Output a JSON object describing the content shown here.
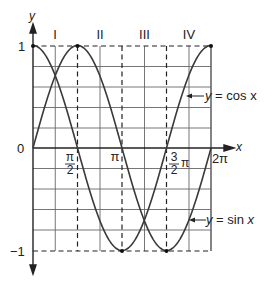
{
  "chart_data": {
    "type": "line",
    "title": "",
    "xlabel": "x",
    "ylabel": "y",
    "xlim": [
      0,
      6.2832
    ],
    "ylim": [
      -1,
      1
    ],
    "grid": true,
    "x_ticks": [
      {
        "value": 1.5708,
        "label_num": "π",
        "label_den": "2",
        "kind": "fraction"
      },
      {
        "value": 3.1416,
        "label": "π"
      },
      {
        "value": 4.7124,
        "label_num": "3",
        "label_den": "2",
        "label_suffix": "π",
        "kind": "mixed"
      },
      {
        "value": 6.2832,
        "label": "2π"
      }
    ],
    "y_ticks": [
      {
        "value": 1,
        "label": "1"
      },
      {
        "value": 0,
        "label": "0"
      },
      {
        "value": -1,
        "label": "−1"
      }
    ],
    "quadrant_labels": [
      "I",
      "II",
      "III",
      "IV"
    ],
    "series": [
      {
        "name": "y = sin x",
        "function": "sin",
        "x": [
          0,
          0.7854,
          1.5708,
          2.3562,
          3.1416,
          3.927,
          4.7124,
          5.4978,
          6.2832
        ],
        "values": [
          0,
          0.707,
          1,
          0.707,
          0,
          -0.707,
          -1,
          -0.707,
          0
        ]
      },
      {
        "name": "y = cos x",
        "function": "cos",
        "x": [
          0,
          0.7854,
          1.5708,
          2.3562,
          3.1416,
          3.927,
          4.7124,
          5.4978,
          6.2832
        ],
        "values": [
          1,
          0.707,
          0,
          -0.707,
          -1,
          -0.707,
          0,
          0.707,
          1
        ]
      }
    ],
    "annotations": [
      {
        "text": "y = cos x",
        "arrow_to_series": "cos",
        "position": "right"
      },
      {
        "text": "y = sin x",
        "arrow_to_series": "sin",
        "position": "right"
      }
    ],
    "marked_points": [
      {
        "x": 0,
        "y": 1
      },
      {
        "x": 1.5708,
        "y": 1
      },
      {
        "x": 6.2832,
        "y": 1
      },
      {
        "x": 3.1416,
        "y": -1
      },
      {
        "x": 4.7124,
        "y": -1
      }
    ]
  },
  "labels": {
    "y_axis": "y",
    "x_axis": "x",
    "y_one": "1",
    "y_zero": "0",
    "y_neg_one": "−1",
    "q1": "I",
    "q2": "II",
    "q3": "III",
    "q4": "IV",
    "pi_half_num": "π",
    "pi_half_den": "2",
    "pi": "π",
    "three_half_num": "3",
    "three_half_den": "2",
    "three_half_suffix": "π",
    "two_pi": "2π",
    "cos_label_y": "y",
    "cos_label_rest": " = cos x",
    "sin_label_y": "y",
    "sin_label_rest": " = sin ",
    "sin_label_x": "x"
  },
  "colors": {
    "curve": "#333333",
    "grid": "#555555",
    "axis": "#222222"
  }
}
